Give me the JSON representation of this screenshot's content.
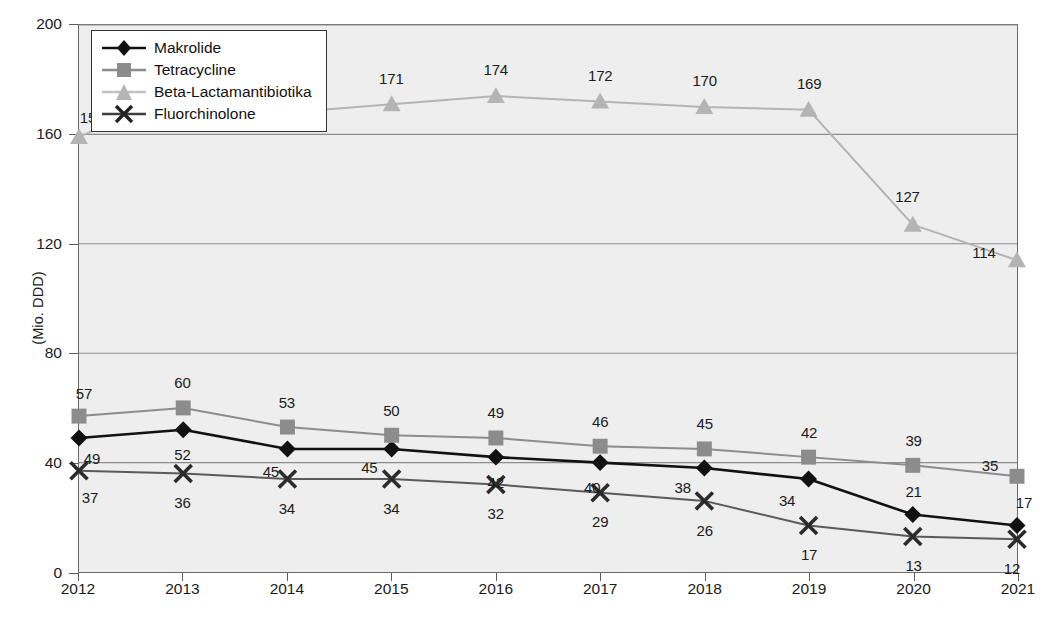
{
  "chart_data": {
    "type": "line",
    "title": "",
    "xlabel": "",
    "ylabel": "(Mio. DDD)",
    "categories": [
      "2012",
      "2013",
      "2014",
      "2015",
      "2016",
      "2017",
      "2018",
      "2019",
      "2020",
      "2021"
    ],
    "x": [
      2012,
      2013,
      2014,
      2015,
      2016,
      2017,
      2018,
      2019,
      2020,
      2021
    ],
    "ylim": [
      0,
      200
    ],
    "yticks": [
      0,
      40,
      80,
      120,
      160,
      200
    ],
    "grid": true,
    "legend_position": "top-left",
    "series": [
      {
        "name": "Makrolide",
        "color": "#111111",
        "marker": "diamond",
        "values": [
          49,
          52,
          45,
          45,
          42,
          40,
          38,
          34,
          21,
          17
        ]
      },
      {
        "name": "Tetracycline",
        "color": "#8c8c8c",
        "marker": "square",
        "values": [
          57,
          60,
          53,
          50,
          49,
          46,
          45,
          42,
          39,
          35
        ]
      },
      {
        "name": "Beta-Lactamantibiotika",
        "color": "#b4b4b4",
        "marker": "triangle",
        "values": [
          159,
          177,
          168,
          171,
          174,
          172,
          170,
          169,
          127,
          114
        ]
      },
      {
        "name": "Fluorchinolone",
        "color": "#5a5a5a",
        "marker": "cross",
        "values": [
          37,
          36,
          34,
          34,
          32,
          29,
          26,
          17,
          13,
          12
        ]
      }
    ]
  },
  "axis": {
    "y_label": "(Mio. DDD)",
    "y_ticks": [
      "0",
      "40",
      "80",
      "120",
      "160",
      "200"
    ],
    "x_ticks": [
      "2012",
      "2013",
      "2014",
      "2015",
      "2016",
      "2017",
      "2018",
      "2019",
      "2020",
      "2021"
    ]
  },
  "legend": {
    "items": [
      {
        "label": "Makrolide"
      },
      {
        "label": "Tetracycline"
      },
      {
        "label": "Beta-Lactamantibiotika"
      },
      {
        "label": "Fluorchinolone"
      }
    ]
  },
  "data_labels": {
    "makrolide": [
      "49",
      "52",
      "45",
      "45",
      "42",
      "40",
      "38",
      "34",
      "21",
      "17"
    ],
    "tetracycline": [
      "57",
      "60",
      "53",
      "50",
      "49",
      "46",
      "45",
      "42",
      "39",
      "35"
    ],
    "beta_lactam": [
      "159",
      "177",
      "168",
      "171",
      "174",
      "172",
      "170",
      "169",
      "127",
      "114"
    ],
    "fluorchinolone": [
      "37",
      "36",
      "34",
      "34",
      "32",
      "29",
      "26",
      "17",
      "13",
      "12"
    ]
  }
}
